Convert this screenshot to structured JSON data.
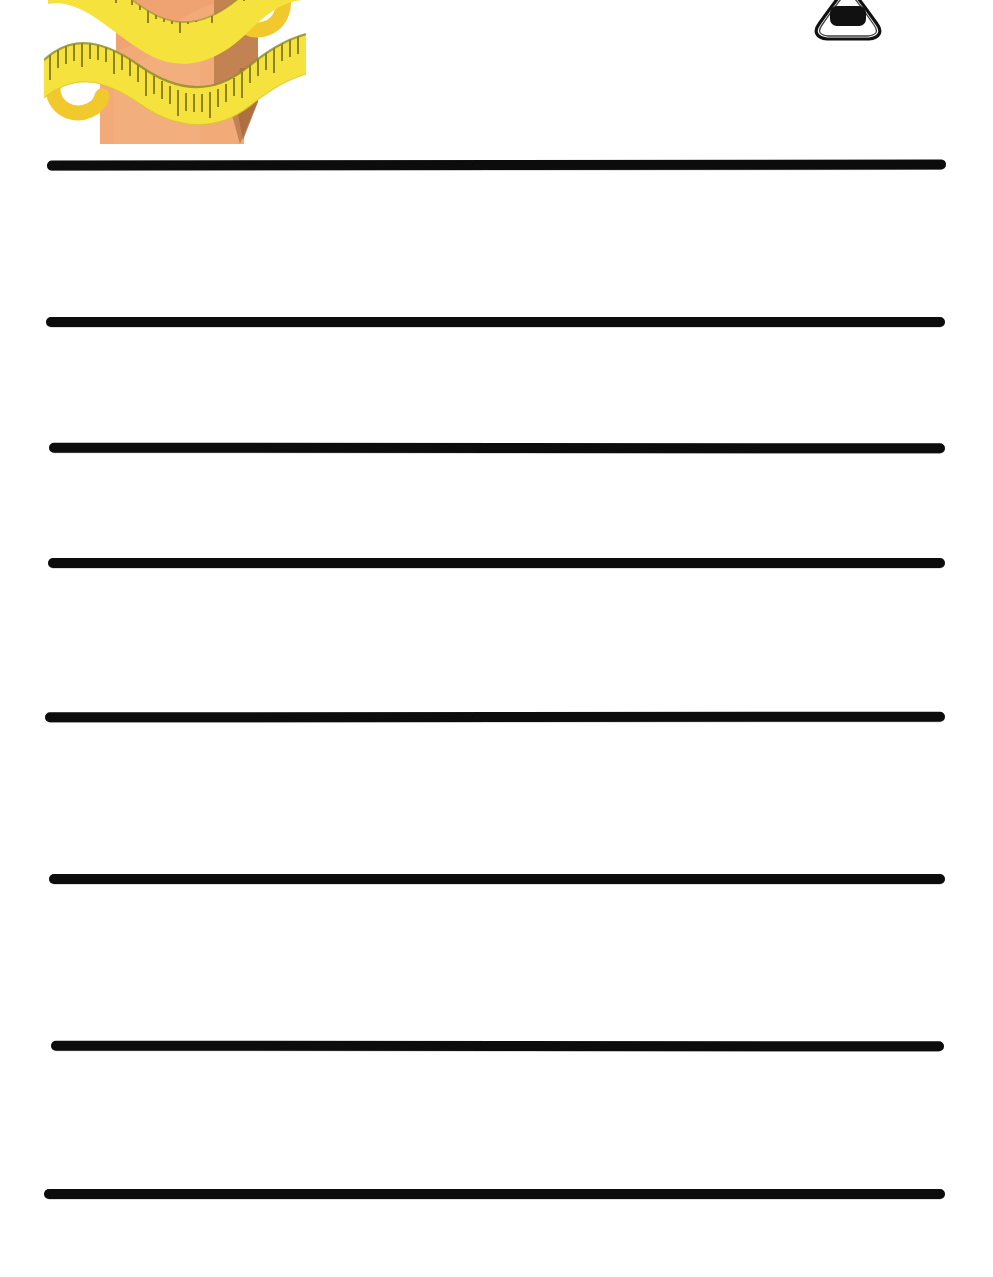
{
  "page": {
    "kind": "handwriting-practice-worksheet",
    "width": 993,
    "height": 1277,
    "background_color": "#FFFFFF",
    "title_text": "",
    "instructions_text": "",
    "body_text": "",
    "page_number": ""
  },
  "palette": {
    "line_color": "#0C0C0C",
    "paper": "#FFFFFF",
    "skin_light": "#F2AA78",
    "skin_mid": "#E79A64",
    "skin_shadow": "#BE7F4F",
    "skin_shadow_dark": "#A96B3E",
    "tape_yellow": "#F5E23C",
    "tape_yellow_dark": "#E8C824",
    "tape_tick": "#3A3410",
    "tape_edge_olive": "#8B8B25",
    "ink": "#141414"
  },
  "ruled_lines": [
    {
      "index": 1,
      "x": 47,
      "y": 160,
      "width": 899,
      "height": 10,
      "tilt_deg": -0.08
    },
    {
      "index": 2,
      "x": 46,
      "y": 317,
      "width": 899,
      "height": 10,
      "tilt_deg": 0.0
    },
    {
      "index": 3,
      "x": 49,
      "y": 443,
      "width": 896,
      "height": 10,
      "tilt_deg": 0.04
    },
    {
      "index": 4,
      "x": 48,
      "y": 558,
      "width": 897,
      "height": 10,
      "tilt_deg": 0.0
    },
    {
      "index": 5,
      "x": 45,
      "y": 712,
      "width": 900,
      "height": 10,
      "tilt_deg": -0.04
    },
    {
      "index": 6,
      "x": 49,
      "y": 874,
      "width": 896,
      "height": 10,
      "tilt_deg": 0.0
    },
    {
      "index": 7,
      "x": 51,
      "y": 1041,
      "width": 893,
      "height": 10,
      "tilt_deg": 0.04
    },
    {
      "index": 8,
      "x": 44,
      "y": 1189,
      "width": 901,
      "height": 10,
      "tilt_deg": 0.0
    }
  ],
  "clipart": {
    "waist_measuring_tape": {
      "name": "waist-with-tape-measure-clipart",
      "description": "Illustration of a human waist/torso wrapped with a yellow tape measure, cropped at top edge of page",
      "x": 44,
      "y": 0,
      "width": 262,
      "height": 144
    },
    "onigiri": {
      "name": "onigiri-rice-ball-clipart",
      "description": "Black outline drawing of a triangular onigiri rice ball with nori seaweed band, cropped at top edge of page",
      "x": 805,
      "y": 0,
      "width": 86,
      "height": 48
    }
  }
}
